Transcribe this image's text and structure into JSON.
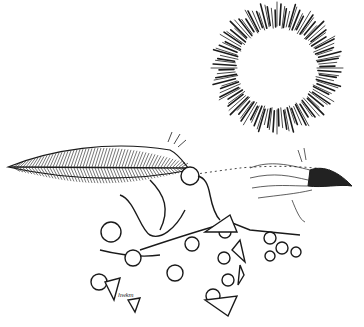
{
  "artwork": {
    "description": "Ink drawing of a bird with a feather tail beneath a rayed sun",
    "colors": {
      "ink": "#1a1a1a",
      "paper": "#ffffff",
      "beak": "#222222"
    },
    "elements": {
      "sun": {
        "cx": 277,
        "cy": 68,
        "inner_r": 40,
        "outer_r": 66,
        "ray_count": 120
      },
      "feather": {
        "label": "feather"
      },
      "bird_head": {
        "label": "bird-head"
      },
      "body_rings": {
        "label": "ring-jointed-body"
      }
    },
    "signature": "hwkm"
  }
}
